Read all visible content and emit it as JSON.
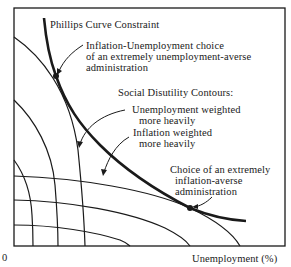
{
  "diagram": {
    "title": "Phillips Curve Constraint",
    "labels": {
      "phillips_curve": "Phillips Curve Constraint",
      "unemp_averse_line1": "Inflation-Unemployment choice",
      "unemp_averse_line2": "of an extremely unemployment-averse",
      "unemp_averse_line3": "administration",
      "contours_heading": "Social Disutility Contours:",
      "unemp_weighted_line1": "Unemployment weighted",
      "unemp_weighted_line2": "more heavily",
      "infl_weighted_line1": "Inflation weighted",
      "infl_weighted_line2": "more heavily",
      "infl_averse_line1": "Choice of an extremely",
      "infl_averse_line2": "inflation-averse",
      "infl_averse_line3": "administration"
    },
    "axes": {
      "origin": "0",
      "xlabel": "Unemployment (%)",
      "ylabel": ""
    },
    "colors": {
      "ink": "#1a1a1a",
      "background": "#ffffff"
    }
  }
}
